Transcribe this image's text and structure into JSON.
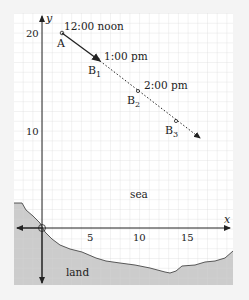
{
  "diagram": {
    "axes": {
      "x_label": "x",
      "y_label": "y"
    },
    "x_ticks": [
      "5",
      "10",
      "15"
    ],
    "y_ticks": [
      "20",
      "10"
    ],
    "points": [
      {
        "name": "A",
        "time": "12:00 noon"
      },
      {
        "name": "B1",
        "base": "B",
        "sub": "1",
        "time": "1:00 pm"
      },
      {
        "name": "B2",
        "base": "B",
        "sub": "2",
        "time": "2:00 pm"
      },
      {
        "name": "B3",
        "base": "B",
        "sub": "3",
        "time": ""
      }
    ],
    "regions": {
      "sea": "sea",
      "land": "land"
    },
    "colors": {
      "grid": "#cfcfcf",
      "land": "#cccccc",
      "frame_bg": "#ffffff",
      "line": "#222222"
    }
  }
}
